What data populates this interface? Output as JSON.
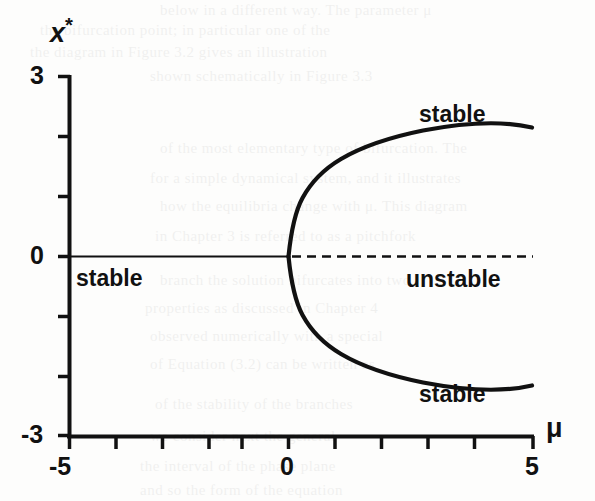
{
  "figure": {
    "kind": "bifurcation-diagram",
    "background_color": "#fdfdfc",
    "ink_color": "#111111"
  },
  "axes": {
    "y_label": "x",
    "y_label_sup": "*",
    "x_label": "μ",
    "y_tick_top": "3",
    "y_tick_mid": "0",
    "y_tick_bottom": "-3",
    "x_tick_left": "-5",
    "x_tick_mid": "0",
    "x_tick_right": "5"
  },
  "annotations": {
    "stable_left": "stable",
    "stable_upper": "stable",
    "stable_lower": "stable",
    "unstable_right": "unstable"
  },
  "chart_data": {
    "type": "line",
    "title": "",
    "xlabel": "μ",
    "ylabel": "x*",
    "xlim": [
      -5,
      5
    ],
    "ylim": [
      -3,
      3
    ],
    "grid": false,
    "legend": "none",
    "x_ticks": [
      -5,
      -4,
      -3,
      -2,
      -1,
      0,
      1,
      2,
      3,
      4,
      5
    ],
    "x_tick_labels": [
      "-5",
      "",
      "",
      "",
      "",
      "0",
      "",
      "",
      "",
      "",
      "5"
    ],
    "y_ticks": [
      -3,
      -2,
      -1,
      0,
      1,
      2,
      3
    ],
    "y_tick_labels": [
      "-3",
      "",
      "",
      "0",
      "",
      "",
      "3"
    ],
    "series": [
      {
        "name": "trivial branch (stable)",
        "style": "solid-thin",
        "stability": "stable",
        "x": [
          -5,
          -4,
          -3,
          -2,
          -1,
          0
        ],
        "values": [
          0,
          0,
          0,
          0,
          0,
          0
        ]
      },
      {
        "name": "trivial branch (unstable)",
        "style": "dashed",
        "stability": "unstable",
        "x": [
          0,
          1,
          2,
          3,
          4,
          5
        ],
        "values": [
          0,
          0,
          0,
          0,
          0,
          0
        ]
      },
      {
        "name": "upper branch x* = +sqrt(mu)",
        "style": "solid-thick",
        "stability": "stable",
        "x": [
          0,
          0.25,
          0.5,
          1,
          1.5,
          2,
          2.5,
          3,
          3.5,
          4,
          4.5,
          5
        ],
        "values": [
          0,
          0.5,
          0.707,
          1.0,
          1.225,
          1.414,
          1.581,
          1.732,
          1.871,
          2.0,
          2.121,
          2.236
        ]
      },
      {
        "name": "lower branch x* = -sqrt(mu)",
        "style": "solid-thick",
        "stability": "stable",
        "x": [
          0,
          0.25,
          0.5,
          1,
          1.5,
          2,
          2.5,
          3,
          3.5,
          4,
          4.5,
          5
        ],
        "values": [
          0,
          -0.5,
          -0.707,
          -1.0,
          -1.225,
          -1.414,
          -1.581,
          -1.732,
          -1.871,
          -2.0,
          -2.121,
          -2.236
        ]
      }
    ],
    "annotations": [
      {
        "text": "stable",
        "x": -4.4,
        "y": -0.3
      },
      {
        "text": "stable",
        "x": 3.3,
        "y": 2.55
      },
      {
        "text": "stable",
        "x": 3.3,
        "y": -2.45
      },
      {
        "text": "unstable",
        "x": 4.6,
        "y": -0.42
      }
    ]
  },
  "ghost_text": [
    {
      "text": "below in a different way. The parameter   μ",
      "x": 160,
      "y": 2
    },
    {
      "text": "the bifurcation point; in particular one of the",
      "x": 40,
      "y": 22
    },
    {
      "text": "the diagram in Figure 3.2 gives an illustration",
      "x": 30,
      "y": 44
    },
    {
      "text": "shown schematically in Figure 3.3",
      "x": 150,
      "y": 68
    },
    {
      "text": "of the most elementary type of bifurcation. The",
      "x": 160,
      "y": 140
    },
    {
      "text": "for a simple dynamical system, and it illustrates",
      "x": 150,
      "y": 170
    },
    {
      "text": "how the equilibria change with μ. This diagram",
      "x": 160,
      "y": 198
    },
    {
      "text": "in Chapter 3 is referred to as a pitchfork",
      "x": 155,
      "y": 228
    },
    {
      "text": "branch the solution bifurcates into two",
      "x": 160,
      "y": 272
    },
    {
      "text": "properties as discussed in Chapter 4",
      "x": 145,
      "y": 300
    },
    {
      "text": "observed numerically with a special",
      "x": 150,
      "y": 328
    },
    {
      "text": "of Equation (3.2) can be written as",
      "x": 150,
      "y": 356
    },
    {
      "text": "of the stability of the branches",
      "x": 155,
      "y": 396
    },
    {
      "text": "we consider next the general",
      "x": 150,
      "y": 428
    },
    {
      "text": "the interval of the phase plane",
      "x": 140,
      "y": 458
    },
    {
      "text": "and so the form of the equation",
      "x": 140,
      "y": 482
    }
  ]
}
